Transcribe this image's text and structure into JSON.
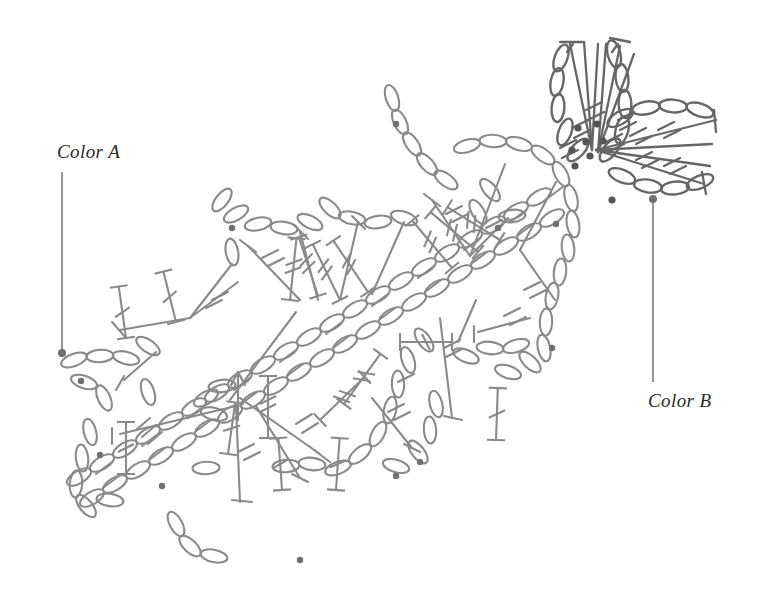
{
  "page": {
    "width": 768,
    "height": 610,
    "background": "#ffffff"
  },
  "colors": {
    "stroke": "#8a8a8a",
    "stroke_dark": "#5f5f5f",
    "dot": "#6e6e6e",
    "leader": "#7a7a7a",
    "text": "#2b2b2b"
  },
  "annotations": {
    "color_a": {
      "label": "Color A",
      "label_x": 57,
      "label_y": 141,
      "leader": {
        "x1": 62,
        "y1": 172,
        "x2": 62,
        "y2": 352
      },
      "dot": {
        "x": 62,
        "y": 353,
        "r": 4
      }
    },
    "color_b": {
      "label": "Color B",
      "label_x": 648,
      "label_y": 390,
      "leader": {
        "x1": 653,
        "y1": 200,
        "x2": 653,
        "y2": 382
      },
      "dot": {
        "x": 653,
        "y": 199,
        "r": 4
      }
    }
  },
  "chart_data": {
    "type": "diagram",
    "symbols": [
      {
        "name": "chain-stitch",
        "glyph": "oval",
        "meaning": "chain (ch)"
      },
      {
        "name": "double-crochet",
        "glyph": "vertical line with T top and one slash",
        "meaning": "double crochet (dc)"
      },
      {
        "name": "treble-crochet",
        "glyph": "line with T top and two slashes",
        "meaning": "treble crochet (tr)"
      },
      {
        "name": "slip-stitch-dot",
        "glyph": "filled dot",
        "meaning": "slip stitch / join"
      },
      {
        "name": "start-arrow",
        "glyph": "upward arrow",
        "meaning": "start of work direction"
      }
    ],
    "regions": [
      {
        "name": "main-body",
        "description": "large diagonal lattice of chain arcs and treble fans forming a leaf/shawl body"
      },
      {
        "name": "central-spine",
        "description": "double row of chain ovals running lower-left to upper-right through the center"
      },
      {
        "name": "flower-motif",
        "description": "upper-right flower of three petal fans radiating from a cluster of join dots"
      }
    ],
    "leader_labels": [
      "Color A",
      "Color B"
    ]
  }
}
